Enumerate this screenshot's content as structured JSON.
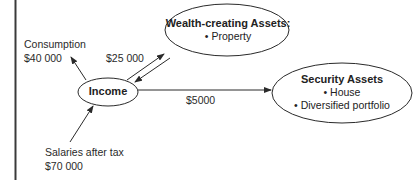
{
  "diagram": {
    "nodes": {
      "income": {
        "title": "Income"
      },
      "wealth": {
        "title": "Wealth-creating Assets:",
        "items": [
          "• Property"
        ]
      },
      "security": {
        "title": "Security Assets",
        "items": [
          "• House",
          "• Diversified portfolio"
        ]
      }
    },
    "labels": {
      "consumption": "Consumption",
      "consumption_amount": "$40 000",
      "to_wealth_amount": "$25 000",
      "to_security_amount": "$5000",
      "salaries": "Salaries after tax",
      "salaries_amount": "$70 000"
    },
    "edges": [
      {
        "from": "income",
        "to": "consumption",
        "label": "$40 000"
      },
      {
        "from": "income",
        "to": "wealth",
        "label": "$25 000"
      },
      {
        "from": "wealth",
        "to": "income",
        "label": ""
      },
      {
        "from": "income",
        "to": "security",
        "label": "$5000"
      },
      {
        "from": "salaries",
        "to": "income",
        "label": "$70 000"
      }
    ],
    "colors": {
      "line": "#2a2a2a",
      "background": "#ffffff"
    }
  }
}
